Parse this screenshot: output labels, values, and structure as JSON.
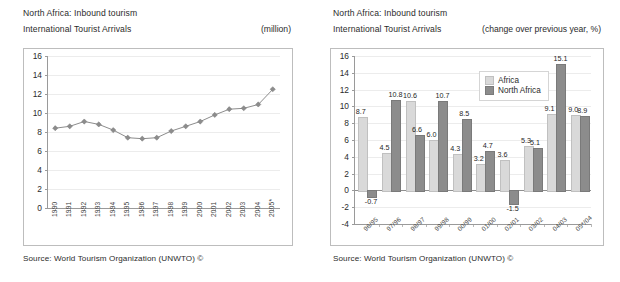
{
  "left_panel": {
    "title_line1": "North Africa: Inbound tourism",
    "title_line2": "International Tourist Arrivals",
    "unit": "(million)",
    "source": "Source: World Tourism Organization (UNWTO) ©"
  },
  "right_panel": {
    "title_line1": "North Africa: Inbound tourism",
    "title_line2": "International Tourist Arrivals",
    "unit": "(change over previous year, %)",
    "source": "Source: World Tourism Organization (UNWTO) ©",
    "legend": [
      {
        "label": "Africa",
        "color": "#d9d9d9"
      },
      {
        "label": "North Africa",
        "color": "#8c8c8c"
      }
    ]
  },
  "chart_data": [
    {
      "type": "line",
      "title": "North Africa: Inbound tourism – International Tourist Arrivals",
      "xlabel": "",
      "ylabel": "",
      "unit": "(million)",
      "ylim": [
        0,
        16
      ],
      "yticks": [
        0,
        2,
        4,
        6,
        8,
        10,
        12,
        14,
        16
      ],
      "ytick_labels": [
        "0",
        "2",
        "4",
        "6",
        "8",
        "10",
        "12",
        "14",
        "16"
      ],
      "grid": true,
      "legend": "none",
      "marker": "diamond",
      "line_color": "#8c8c8c",
      "categories": [
        "1990",
        "1991",
        "1992",
        "1993",
        "1994",
        "1995",
        "1996",
        "1997",
        "1998",
        "1999",
        "2000",
        "2001",
        "2002",
        "2003",
        "2004",
        "2005*"
      ],
      "values": [
        8.4,
        8.6,
        9.1,
        8.8,
        8.2,
        7.4,
        7.3,
        7.4,
        8.1,
        8.6,
        9.1,
        9.8,
        10.4,
        10.5,
        10.9,
        12.5
      ]
    },
    {
      "type": "bar",
      "title": "North Africa: Inbound tourism – International Tourist Arrivals",
      "xlabel": "",
      "ylabel": "",
      "unit": "(change over previous year, %)",
      "ylim": [
        -4,
        16
      ],
      "yticks": [
        -4,
        -2,
        0,
        2,
        4,
        6,
        8,
        10,
        12,
        14,
        16
      ],
      "ytick_labels": [
        "-4",
        "-2",
        "0",
        "2",
        "4",
        "6",
        "8",
        "10",
        "12",
        "14",
        "16"
      ],
      "grid": true,
      "legend": "inside-top-right",
      "categories": [
        "96/95",
        "97/96",
        "98/97",
        "99/98",
        "00/99",
        "01/00",
        "02/01",
        "03/02",
        "04/03",
        "05*/04"
      ],
      "series": [
        {
          "name": "Africa",
          "color": "#d9d9d9",
          "values": [
            8.7,
            4.5,
            10.6,
            6.0,
            4.3,
            3.2,
            3.6,
            5.3,
            9.1,
            9.0
          ]
        },
        {
          "name": "North Africa",
          "color": "#8c8c8c",
          "values": [
            -0.7,
            10.8,
            6.6,
            10.7,
            8.5,
            4.7,
            -1.5,
            5.1,
            15.1,
            8.9
          ]
        }
      ],
      "data_labels": [
        "8.7",
        "-0.7",
        "4.5",
        "10.8",
        "10.6",
        "6.6",
        "6.0",
        "10.7",
        "4.3",
        "8.5",
        "3.2",
        "4.7",
        "3.6",
        "5.3",
        "5.1",
        "9.1",
        "15.1",
        "9.0",
        "8.9",
        "-1.5"
      ]
    }
  ]
}
